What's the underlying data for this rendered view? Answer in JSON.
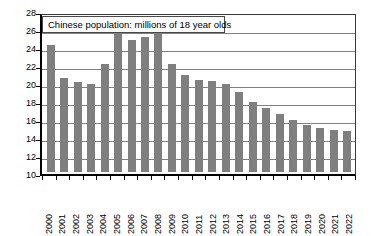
{
  "chart_data": {
    "type": "bar",
    "title": "Chinese population: millions of 18 year olds",
    "xlabel": "",
    "ylabel": "",
    "ylim": [
      10,
      28
    ],
    "ytick_step": 2,
    "yticks": [
      28,
      26,
      24,
      22,
      20,
      18,
      16,
      14,
      12,
      10
    ],
    "grid": true,
    "legend": false,
    "bar_color": "#7f7f7f",
    "categories": [
      "2000",
      "2001",
      "2002",
      "2003",
      "2004",
      "2005",
      "2006",
      "2007",
      "2008",
      "2009",
      "2010",
      "2011",
      "2012",
      "2013",
      "2014",
      "2015",
      "2016",
      "2017",
      "2018",
      "2019",
      "2020",
      "2021",
      "2022"
    ],
    "values": [
      24.1,
      20.4,
      20.0,
      19.8,
      22.0,
      26.2,
      24.7,
      25.0,
      26.2,
      22.0,
      20.8,
      20.2,
      20.1,
      19.8,
      18.9,
      17.8,
      17.1,
      16.4,
      15.8,
      15.2,
      14.9,
      14.7,
      14.6
    ]
  }
}
